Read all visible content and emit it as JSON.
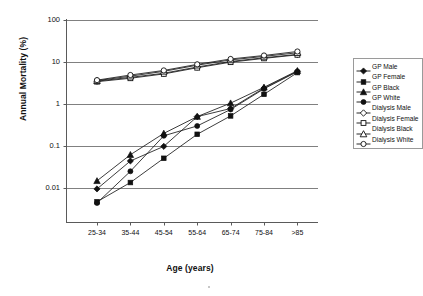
{
  "chart_data": {
    "type": "line",
    "title": "",
    "xlabel": "Age (years)",
    "ylabel": "Annual Mortality (%)",
    "yscale": "log",
    "ylim": [
      0.001,
      100
    ],
    "ytick_labels": [
      "100",
      "10",
      "1",
      "0.1",
      "0.01"
    ],
    "ytick_values": [
      100,
      10,
      1,
      0.1,
      0.01
    ],
    "grid": "horizontal",
    "legend_position": "right",
    "categories": [
      "25-34",
      "35-44",
      "45-54",
      "55-64",
      "65-74",
      "75-84",
      ">85"
    ],
    "series": [
      {
        "name": "GP Male",
        "marker": "filled-diamond",
        "values": [
          0.0095,
          0.044,
          0.098,
          0.5,
          0.78,
          2.4,
          6.0
        ]
      },
      {
        "name": "GP Female",
        "marker": "filled-square",
        "values": [
          0.0047,
          0.0135,
          0.051,
          0.19,
          0.52,
          1.7,
          5.6
        ]
      },
      {
        "name": "GP Black",
        "marker": "filled-triangle",
        "values": [
          0.0148,
          0.062,
          0.2,
          0.5,
          1.05,
          2.5,
          6.2
        ]
      },
      {
        "name": "GP White",
        "marker": "filled-circle",
        "values": [
          0.0044,
          0.025,
          0.175,
          0.3,
          0.74,
          2.3,
          5.9
        ]
      },
      {
        "name": "Dialysis Male",
        "marker": "open-diamond",
        "values": [
          3.5,
          4.3,
          5.4,
          7.6,
          10.3,
          12.6,
          15.2
        ]
      },
      {
        "name": "Dialysis Female",
        "marker": "open-square",
        "values": [
          3.4,
          4.1,
          5.2,
          7.3,
          9.9,
          12.2,
          14.8
        ]
      },
      {
        "name": "Dialysis Black",
        "marker": "open-triangle",
        "values": [
          3.6,
          4.6,
          6.0,
          8.4,
          11.2,
          13.6,
          16.6
        ]
      },
      {
        "name": "Dialysis White",
        "marker": "open-circle",
        "values": [
          3.7,
          4.9,
          6.3,
          8.8,
          11.8,
          14.3,
          17.8
        ]
      }
    ]
  },
  "axes": {
    "y_title": "Annual Mortality (%)",
    "x_title": "Age (years)",
    "y_ticks": [
      {
        "label": "100"
      },
      {
        "label": "10"
      },
      {
        "label": "1"
      },
      {
        "label": "0.1"
      },
      {
        "label": "0.01"
      }
    ],
    "x_ticks": [
      {
        "label": "25-34"
      },
      {
        "label": "35-44"
      },
      {
        "label": "45-54"
      },
      {
        "label": "55-64"
      },
      {
        "label": "65-74"
      },
      {
        "label": "75-84"
      },
      {
        "label": ">85"
      }
    ]
  },
  "legend": {
    "items": [
      {
        "label": "GP Male",
        "marker": "filled-diamond"
      },
      {
        "label": "GP Female",
        "marker": "filled-square"
      },
      {
        "label": "GP Black",
        "marker": "filled-triangle"
      },
      {
        "label": "GP White",
        "marker": "filled-circle"
      },
      {
        "label": "Dialysis Male",
        "marker": "open-diamond"
      },
      {
        "label": "Dialysis Female",
        "marker": "open-square"
      },
      {
        "label": "Dialysis Black",
        "marker": "open-triangle"
      },
      {
        "label": "Dialysis White",
        "marker": "open-circle"
      }
    ]
  },
  "colors": {
    "line": "#1a1a1a",
    "grid": "#808080",
    "axis": "#4d4d4d",
    "marker_fill": "#111111",
    "marker_open": "#ffffff",
    "background": "#ffffff"
  }
}
